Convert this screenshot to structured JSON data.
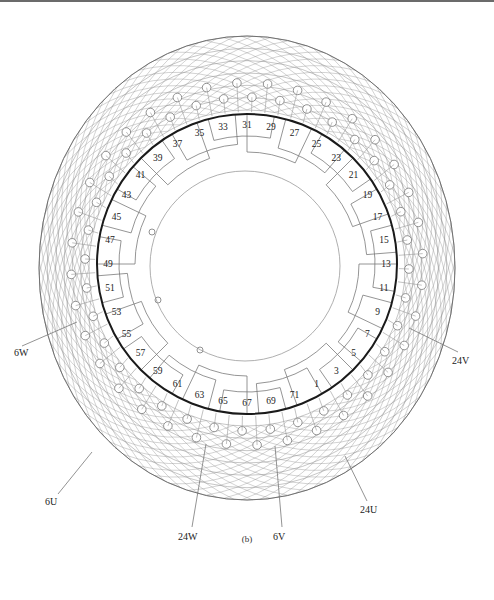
{
  "figure": {
    "caption": "(b)",
    "center": {
      "x": 247,
      "y": 264
    },
    "stator_ring_radius": 150,
    "inner_ring_radius": 95,
    "outer_mesh": {
      "rx": 208,
      "ry": 232
    },
    "colors": {
      "ring": "#1a1a1a",
      "winding": "#7a7a7a",
      "mesh": "#8a8a8a",
      "text": "#222222",
      "background": "#ffffff"
    }
  },
  "slot_labels": [
    "1",
    "3",
    "5",
    "7",
    "9",
    "11",
    "13",
    "15",
    "17",
    "19",
    "21",
    "23",
    "25",
    "27",
    "29",
    "31",
    "33",
    "35",
    "37",
    "39",
    "41",
    "43",
    "45",
    "47",
    "49",
    "51",
    "53",
    "55",
    "57",
    "59",
    "61",
    "63",
    "65",
    "67",
    "69",
    "71"
  ],
  "terminal_labels": [
    {
      "text": "6W",
      "x": 14,
      "y": 356,
      "lx1": 22,
      "ly1": 346,
      "lx2": 77,
      "ly2": 322
    },
    {
      "text": "24V",
      "x": 452,
      "y": 364,
      "lx1": 458,
      "ly1": 352,
      "lx2": 409,
      "ly2": 328
    },
    {
      "text": "6U",
      "x": 45,
      "y": 505,
      "lx1": 58,
      "ly1": 494,
      "lx2": 92,
      "ly2": 452
    },
    {
      "text": "24U",
      "x": 360,
      "y": 513,
      "lx1": 367,
      "ly1": 501,
      "lx2": 345,
      "ly2": 456
    },
    {
      "text": "24W",
      "x": 178,
      "y": 540,
      "lx1": 192,
      "ly1": 527,
      "lx2": 206,
      "ly2": 444
    },
    {
      "text": "6V",
      "x": 273,
      "y": 540,
      "lx1": 282,
      "ly1": 527,
      "lx2": 275,
      "ly2": 446
    }
  ]
}
